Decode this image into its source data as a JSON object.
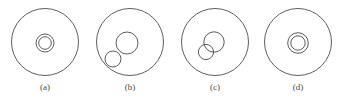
{
  "figure": {
    "width": 339,
    "height": 101,
    "background_color": "#ffffff",
    "stroke_color": "#4a4a4a",
    "label_color": "#4a4a4a"
  },
  "panels": [
    {
      "id": "a",
      "label": "(a)",
      "label_x": 25,
      "label_y": 82,
      "relation": "concentric",
      "outer": {
        "cx": 45,
        "cy": 42,
        "r": 33.5
      },
      "inner": [
        {
          "name": "inner-ring-outer",
          "cx": 45,
          "cy": 43,
          "r": 9
        },
        {
          "name": "inner-ring-inner",
          "cx": 45,
          "cy": 43,
          "r": 6.3
        }
      ]
    },
    {
      "id": "b",
      "label": "(b)",
      "label_x": 110,
      "label_y": 82,
      "relation": "separate",
      "outer": {
        "cx": 130,
        "cy": 42,
        "r": 33.5
      },
      "inner": [
        {
          "name": "large-inner-circle",
          "cx": 127,
          "cy": 43,
          "r": 11
        },
        {
          "name": "small-inner-circle",
          "cx": 113,
          "cy": 59,
          "r": 8
        }
      ]
    },
    {
      "id": "c",
      "label": "(c)",
      "label_x": 195,
      "label_y": 82,
      "relation": "intersecting",
      "outer": {
        "cx": 215,
        "cy": 42,
        "r": 33.5
      },
      "inner": [
        {
          "name": "large-inner-circle",
          "cx": 214,
          "cy": 42,
          "r": 10.2
        },
        {
          "name": "small-inner-circle",
          "cx": 206,
          "cy": 52,
          "r": 7.6
        }
      ]
    },
    {
      "id": "d",
      "label": "(d)",
      "label_x": 278,
      "label_y": 82,
      "relation": "concentric",
      "outer": {
        "cx": 298,
        "cy": 42,
        "r": 33.5
      },
      "inner": [
        {
          "name": "inner-ring-outer",
          "cx": 298,
          "cy": 43,
          "r": 10.3
        },
        {
          "name": "inner-ring-inner",
          "cx": 298,
          "cy": 43,
          "r": 7.2
        }
      ]
    }
  ]
}
